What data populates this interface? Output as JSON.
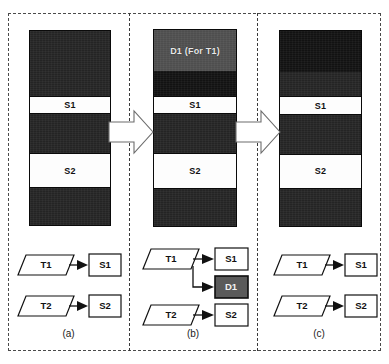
{
  "figure": {
    "type": "diagram",
    "panels": [
      {
        "caption": "(a)",
        "bar": {
          "name": "storage-bar-a",
          "bands": [
            {
              "label": "",
              "style": "dark",
              "height_pct": 33.5
            },
            {
              "label": "S1",
              "style": "white",
              "height_pct": 9.5
            },
            {
              "label": "",
              "style": "dark",
              "height_pct": 20.0
            },
            {
              "label": "S2",
              "style": "white",
              "height_pct": 18.0
            },
            {
              "label": "",
              "style": "dark",
              "height_pct": 19.0
            }
          ]
        },
        "flow": {
          "tasks": [
            "T1",
            "T2"
          ],
          "targets": [
            "S1",
            "S2"
          ],
          "edges": [
            {
              "from": "T1",
              "to": "S1"
            },
            {
              "from": "T2",
              "to": "S2"
            }
          ]
        }
      },
      {
        "caption": "(b)",
        "bar": {
          "name": "storage-bar-b",
          "bands": [
            {
              "label": "D1 (For T1)",
              "style": "gray",
              "height_pct": 21.0
            },
            {
              "label": "",
              "style": "darker",
              "height_pct": 12.5
            },
            {
              "label": "S1",
              "style": "white",
              "height_pct": 9.5
            },
            {
              "label": "",
              "style": "dark",
              "height_pct": 20.0
            },
            {
              "label": "S2",
              "style": "white",
              "height_pct": 18.0
            },
            {
              "label": "",
              "style": "dark",
              "height_pct": 19.0
            }
          ]
        },
        "flow": {
          "tasks": [
            "T1",
            "T2"
          ],
          "targets": [
            "S1",
            "D1",
            "S2"
          ],
          "edges": [
            {
              "from": "T1",
              "to": "S1"
            },
            {
              "from": "T1",
              "to": "D1"
            },
            {
              "from": "T2",
              "to": "S2"
            }
          ]
        }
      },
      {
        "caption": "(c)",
        "bar": {
          "name": "storage-bar-c",
          "bands": [
            {
              "label": "",
              "style": "darker",
              "height_pct": 21.0
            },
            {
              "label": "",
              "style": "dark",
              "height_pct": 12.5
            },
            {
              "label": "S1",
              "style": "white",
              "height_pct": 9.5
            },
            {
              "label": "",
              "style": "dark",
              "height_pct": 20.0
            },
            {
              "label": "S2",
              "style": "white",
              "height_pct": 18.0
            },
            {
              "label": "",
              "style": "dark",
              "height_pct": 19.0
            }
          ]
        },
        "flow": {
          "tasks": [
            "T1",
            "T2"
          ],
          "targets": [
            "S1",
            "S2"
          ],
          "edges": [
            {
              "from": "T1",
              "to": "S1"
            },
            {
              "from": "T2",
              "to": "S2"
            }
          ]
        }
      }
    ],
    "labels": {
      "s1": "S1",
      "s2": "S2",
      "d1": "D1",
      "t1": "T1",
      "t2": "T2",
      "d1_region": "D1 (For T1)",
      "caption_a": "(a)",
      "caption_b": "(b)",
      "caption_c": "(c)"
    },
    "transitions": [
      {
        "name": "arrow-a-to-b",
        "glyph": "block-arrow-right"
      },
      {
        "name": "arrow-b-to-c",
        "glyph": "block-arrow-right"
      }
    ],
    "colors": {
      "dark_band": "#242424",
      "darker_band": "#121212",
      "gray_band": "#4e4e4e",
      "white_band": "#fdfdfd",
      "d1_box_fill": "#5a5a5a",
      "outline": "#111111",
      "frame_dash": "#4a4a4a"
    }
  }
}
